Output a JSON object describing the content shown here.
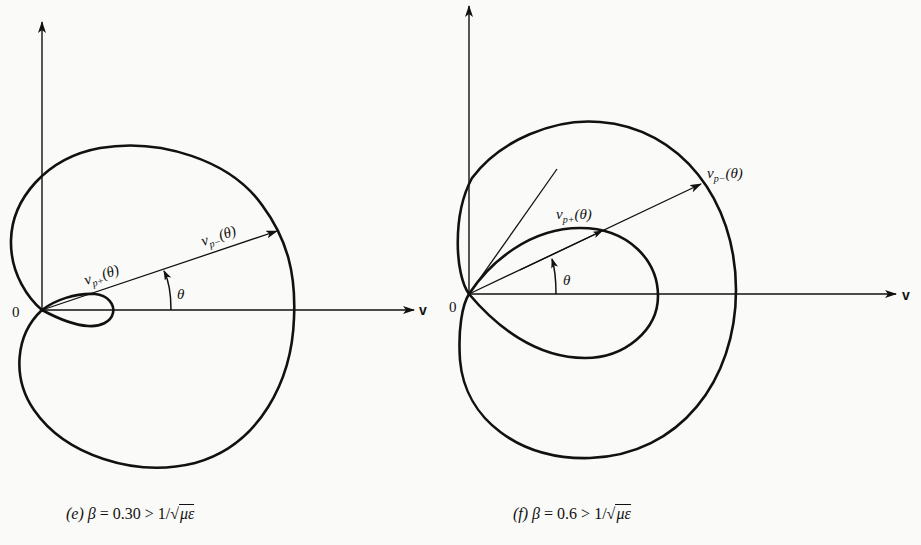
{
  "figures": [
    {
      "id": "e",
      "caption": {
        "label": "(e)",
        "beta_symbol": "β",
        "equals": "=",
        "beta_value": "0.30",
        "relation": ">",
        "rhs_prefix": "1/",
        "rhs_radical": "√",
        "rhs_radicand": "με"
      },
      "origin_label": "0",
      "axis_label": "v",
      "angle_label": "θ",
      "inner_vector_label": {
        "v": "v",
        "sub": "p+",
        "arg": "(θ)"
      },
      "outer_vector_label": {
        "v": "v",
        "sub": "p−",
        "arg": "(θ)"
      }
    },
    {
      "id": "f",
      "caption": {
        "label": "(f)",
        "beta_symbol": "β",
        "equals": "=",
        "beta_value": "0.6",
        "relation": ">",
        "rhs_prefix": "1/",
        "rhs_radical": "√",
        "rhs_radicand": "με"
      },
      "origin_label": "0",
      "axis_label": "v",
      "angle_label": "θ",
      "inner_vector_label": {
        "v": "v",
        "sub": "p+",
        "arg": "(θ)"
      },
      "outer_vector_label": {
        "v": "v",
        "sub": "p−",
        "arg": "(θ)"
      }
    }
  ],
  "colors": {
    "ink": "#111111",
    "paper": "#fafaf8"
  }
}
